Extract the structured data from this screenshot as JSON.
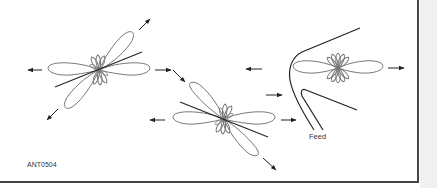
{
  "figure": {
    "id_label": "ANT0504",
    "feed_label": "Feed",
    "colors": {
      "lobe": "#777777",
      "line": "#222222",
      "arrow": "#222222",
      "frame": "#444444"
    },
    "patterns": [
      {
        "name": "pattern-1",
        "center": [
          99,
          70
        ],
        "tilt_deg": -22
      },
      {
        "name": "pattern-2",
        "center": [
          224,
          119
        ],
        "tilt_deg": 22
      },
      {
        "name": "pattern-3-with-reflector",
        "center": [
          338,
          68
        ],
        "tilt_deg": 0
      }
    ]
  }
}
